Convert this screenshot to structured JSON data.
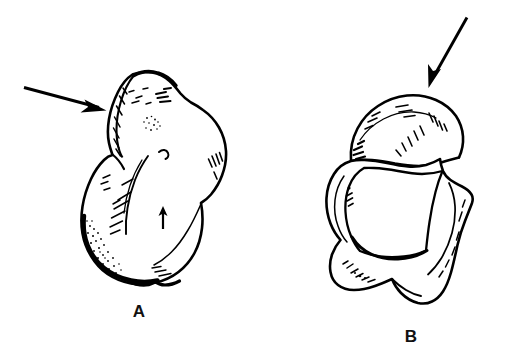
{
  "figure": {
    "type": "anatomical-line-drawing",
    "background_color": "#ffffff",
    "ink_color": "#000000",
    "width": 523,
    "height": 355,
    "panel_count": 2
  },
  "panels": [
    {
      "id": "A",
      "label": "A",
      "label_position": {
        "x": 139,
        "y": 312
      },
      "subject": "bone specimen, irregular ovoid with superior ridge",
      "annotations": [
        {
          "name": "pointer-arrow-a",
          "kind": "arrow",
          "direction": "right-down",
          "points_to": "superior-ridge-flap",
          "from": {
            "x": 24,
            "y": 88
          },
          "to": {
            "x": 104,
            "y": 110
          }
        },
        {
          "name": "detail-arrow-a",
          "kind": "small-arrow",
          "direction": "up",
          "points_to": "mid-body-landmark",
          "from": {
            "x": 163,
            "y": 228
          },
          "to": {
            "x": 163,
            "y": 208
          }
        }
      ],
      "surface_marks": [
        "hatching",
        "stippling",
        "contour-lines"
      ]
    },
    {
      "id": "B",
      "label": "B",
      "label_position": {
        "x": 411,
        "y": 337
      },
      "subject": "bone specimen, rounded blocky body with superior dome",
      "annotations": [
        {
          "name": "pointer-arrow-b",
          "kind": "arrow",
          "direction": "down-left",
          "points_to": "superior-dome",
          "from": {
            "x": 466,
            "y": 18
          },
          "to": {
            "x": 430,
            "y": 88
          }
        }
      ],
      "surface_marks": [
        "hatching",
        "contour-lines"
      ]
    }
  ],
  "labels": {
    "panel_a": "A",
    "panel_b": "B"
  }
}
